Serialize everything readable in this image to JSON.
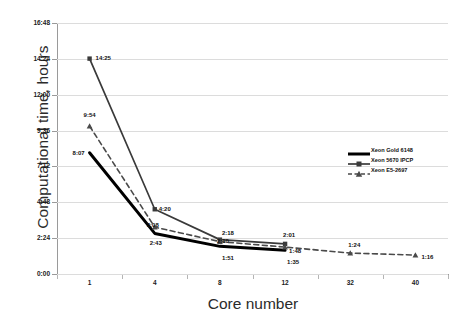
{
  "chart_data": {
    "type": "line",
    "title": "",
    "xlabel": "Core number",
    "ylabel": "Computational time, hours",
    "categories": [
      "1",
      "4",
      "8",
      "12",
      "32",
      "40"
    ],
    "x_tick_labels": [
      "1",
      "4",
      "8",
      "12",
      "32",
      "40"
    ],
    "y_tick_labels": [
      "0:00",
      "2:24",
      "4:48",
      "7:12",
      "9:36",
      "12:00",
      "14:24",
      "16:48"
    ],
    "y_tick_values_hours": [
      0,
      2.4,
      4.8,
      7.2,
      9.6,
      12.0,
      14.4,
      16.8
    ],
    "ylim": [
      0,
      16.8
    ],
    "grid": true,
    "legend_position": "right-middle",
    "series": [
      {
        "name": "Xeon Gold 6148",
        "marker": "none",
        "line_style": "solid",
        "line_width": "thick",
        "color": "#000000",
        "x": [
          "1",
          "4",
          "8",
          "12"
        ],
        "labels": [
          "8:07",
          "2:43",
          "1:51",
          "1:35"
        ],
        "values_hours": [
          8.1167,
          2.7167,
          1.85,
          1.5833
        ]
      },
      {
        "name": "Xeon 5670 IPCP",
        "marker": "square",
        "line_style": "solid",
        "line_width": "medium",
        "color": "#3f3f3f",
        "x": [
          "1",
          "4",
          "8",
          "12"
        ],
        "labels": [
          "14:25",
          "4:20",
          "2:18",
          "2:01"
        ],
        "values_hours": [
          14.4167,
          4.3333,
          2.3,
          2.0167
        ]
      },
      {
        "name": "Xeon E5-2697",
        "marker": "triangle",
        "line_style": "dashed",
        "line_width": "medium",
        "color": "#4a4a4a",
        "x": [
          "1",
          "4",
          "8",
          "12",
          "32",
          "40"
        ],
        "labels": [
          "9:54",
          "3:08",
          "2:10",
          "1:48",
          "1:24",
          "1:16"
        ],
        "values_hours": [
          9.9,
          3.1333,
          2.1667,
          1.8,
          1.4,
          1.2667
        ]
      }
    ]
  },
  "legend": {
    "entries": [
      {
        "label": "Xeon Gold 6148"
      },
      {
        "label": "Xeon 5670 IPCP"
      },
      {
        "label": "Xeon E5-2697"
      }
    ]
  },
  "axes": {
    "y_title": "Computational time, hours",
    "x_title": "Core number"
  }
}
